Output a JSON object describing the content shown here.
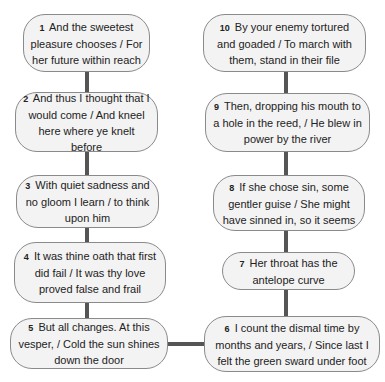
{
  "diagram": {
    "type": "flowchart",
    "colors": {
      "node_fill": "#f3f3f3",
      "node_border": "#8a8a8a",
      "edge": "#555555",
      "text": "#222222",
      "background": "#ffffff"
    },
    "nodes": [
      {
        "id": "1",
        "num": "1",
        "text": "And the sweetest pleasure chooses / For her future within reach"
      },
      {
        "id": "2",
        "num": "2",
        "text": "And thus I thought that I would come / And kneel here where ye knelt before"
      },
      {
        "id": "3",
        "num": "3",
        "text": "With quiet sadness and no gloom I learn / to think upon him"
      },
      {
        "id": "4",
        "num": "4",
        "text": "It was thine oath that first did fail / It was thy love proved false and frail"
      },
      {
        "id": "5",
        "num": "5",
        "text": "But all changes. At this vesper, / Cold the sun shines down the door"
      },
      {
        "id": "6",
        "num": "6",
        "text": "I count the dismal time by months and years, / Since last I felt the green sward under foot"
      },
      {
        "id": "7",
        "num": "7",
        "text": "Her throat has the antelope curve"
      },
      {
        "id": "8",
        "num": "8",
        "text": "If she chose sin, some gentler guise / She might have sinned in, so it seems"
      },
      {
        "id": "9",
        "num": "9",
        "text": "Then, dropping his mouth to a hole in the reed, / He blew in power by the river"
      },
      {
        "id": "10",
        "num": "10",
        "text": "By your enemy tortured and goaded / To march with them, stand in their file"
      }
    ],
    "edges": [
      {
        "from": "1",
        "to": "2"
      },
      {
        "from": "2",
        "to": "3"
      },
      {
        "from": "3",
        "to": "4"
      },
      {
        "from": "4",
        "to": "5"
      },
      {
        "from": "5",
        "to": "6"
      },
      {
        "from": "6",
        "to": "7"
      },
      {
        "from": "7",
        "to": "8"
      },
      {
        "from": "8",
        "to": "9"
      },
      {
        "from": "9",
        "to": "10"
      }
    ]
  }
}
